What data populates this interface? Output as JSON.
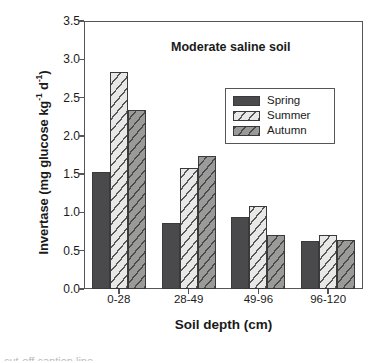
{
  "chart_data": {
    "type": "bar",
    "title": "Moderate saline soil",
    "xlabel": "Soil depth (cm)",
    "ylabel": "Invertase (mg glucose kg-1 d-1)",
    "ylabel_parts": {
      "prefix": "Invertase (mg glucose kg",
      "sup1": "-1",
      "middle": " d",
      "sup2": "-1",
      "suffix": ")"
    },
    "categories": [
      "0-28",
      "28-49",
      "49-96",
      "96-120"
    ],
    "series": [
      {
        "name": "Spring",
        "values": [
          1.53,
          0.86,
          0.94,
          0.63
        ]
      },
      {
        "name": "Summer",
        "values": [
          2.84,
          1.58,
          1.09,
          0.7
        ]
      },
      {
        "name": "Autumn",
        "values": [
          2.34,
          1.74,
          0.71,
          0.64
        ]
      }
    ],
    "ylim": [
      0.0,
      3.5
    ],
    "ytick_labels": [
      "0.0",
      "0.5",
      "1.0",
      "1.5",
      "2.0",
      "2.5",
      "3.0",
      "3.5"
    ],
    "ytick_values": [
      0.0,
      0.5,
      1.0,
      1.5,
      2.0,
      2.5,
      3.0,
      3.5
    ],
    "grid": false,
    "legend_position": "upper-center-right",
    "colors": {
      "spring": "#4a4a4c",
      "summer": "#e8e8e6",
      "autumn": "#9a9a98",
      "axis": "#55565a",
      "outline": "#3a3a3c",
      "background": "#ffffff"
    }
  },
  "caption_strip": "cut-off caption line"
}
